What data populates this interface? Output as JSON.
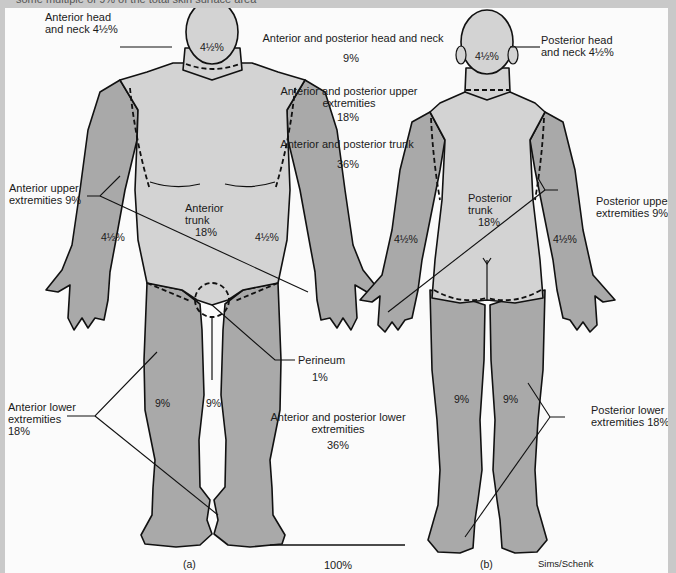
{
  "caption": {
    "partial_text": "some multiple of 9% of the total skin surface area"
  },
  "colors": {
    "background": "#fbfbfb",
    "border": "#c9c9c9",
    "trunk_head_fill": "#d3d3d3",
    "extremity_fill": "#a9a9a9",
    "outline": "#111111"
  },
  "anterior_figure": {
    "panel_label": "(a)",
    "head_value": "4½%",
    "trunk_label_line1": "Anterior",
    "trunk_label_line2": "trunk",
    "trunk_value": "18%",
    "left_arm_value": "4½%",
    "right_arm_value": "4½%",
    "left_leg_value": "9%",
    "right_leg_value": "9%"
  },
  "posterior_figure": {
    "panel_label": "(b)",
    "head_value": "4½%",
    "trunk_label_line1": "Posterior",
    "trunk_label_line2": "trunk",
    "trunk_value": "18%",
    "left_arm_value": "4½%",
    "right_arm_value": "4½%",
    "left_leg_value": "9%",
    "right_leg_value": "9%"
  },
  "callouts": {
    "anterior_head": {
      "line1": "Anterior head",
      "line2": "and neck 4½%"
    },
    "anterior_upper": {
      "line1": "Anterior upper",
      "line2": "extremities 9%"
    },
    "anterior_lower": {
      "line1": "Anterior lower",
      "line2": "extremities",
      "line3": "18%"
    },
    "perineum": {
      "label": "Perineum",
      "value": "1%"
    },
    "posterior_head": {
      "line1": "Posterior head",
      "line2": "and neck 4½%"
    },
    "posterior_upper": {
      "line1": "Posterior upper",
      "line2": "extremities 9%"
    },
    "posterior_lower": {
      "line1": "Posterior lower",
      "line2": "extremities 18%"
    }
  },
  "summary": [
    {
      "label": "Anterior and posterior head and neck",
      "value": "9%"
    },
    {
      "label_line1": "Anterior and posterior upper",
      "label_line2": "extremities",
      "value": "18%"
    },
    {
      "label": "Anterior and posterior trunk",
      "value": "36%"
    },
    {
      "label_line1": "Anterior and posterior lower",
      "label_line2": "extremities",
      "value": "36%"
    }
  ],
  "total": {
    "value": "100%"
  },
  "credit": "Sims/Schenk"
}
